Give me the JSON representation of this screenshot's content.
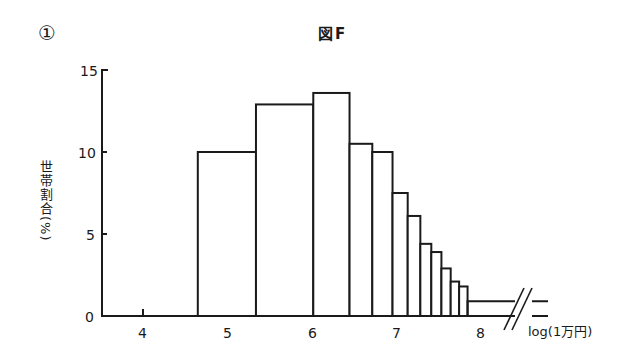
{
  "figure": {
    "panel_number": "①",
    "title": "図F",
    "ylabel": "世帯割合(%)",
    "xlabel": "log(1万円)"
  },
  "axis": {
    "y_ticks": [
      "0",
      "5",
      "10",
      "15"
    ],
    "x_ticks": [
      "4",
      "5",
      "6",
      "7",
      "8"
    ]
  },
  "chart_data": {
    "type": "bar",
    "title": "図F",
    "xlabel": "log(1万円)",
    "ylabel": "世帯割合(%)",
    "ylim": [
      0,
      15
    ],
    "xlim": [
      3.3,
      8.8
    ],
    "y_ticks": [
      0,
      5,
      10,
      15
    ],
    "x_ticks": [
      4,
      5,
      6,
      7,
      8
    ],
    "grid": false,
    "legend": null,
    "note": "Histogram with variable bin widths; last bin extends past an axis break (//).",
    "bins": [
      {
        "x_start": 4.65,
        "x_end": 5.34,
        "value": 10.0
      },
      {
        "x_start": 5.34,
        "x_end": 6.02,
        "value": 12.9
      },
      {
        "x_start": 6.02,
        "x_end": 6.45,
        "value": 13.6
      },
      {
        "x_start": 6.45,
        "x_end": 6.72,
        "value": 10.5
      },
      {
        "x_start": 6.72,
        "x_end": 6.96,
        "value": 10.0
      },
      {
        "x_start": 6.96,
        "x_end": 7.14,
        "value": 7.5
      },
      {
        "x_start": 7.14,
        "x_end": 7.29,
        "value": 6.1
      },
      {
        "x_start": 7.29,
        "x_end": 7.42,
        "value": 4.4
      },
      {
        "x_start": 7.42,
        "x_end": 7.54,
        "value": 3.9
      },
      {
        "x_start": 7.54,
        "x_end": 7.65,
        "value": 2.9
      },
      {
        "x_start": 7.65,
        "x_end": 7.75,
        "value": 2.1
      },
      {
        "x_start": 7.75,
        "x_end": 7.85,
        "value": 1.8
      },
      {
        "x_start": 7.85,
        "x_end": null,
        "value": 0.9
      }
    ],
    "values": [
      10.0,
      12.9,
      13.6,
      10.5,
      10.0,
      7.5,
      6.1,
      4.4,
      3.9,
      2.9,
      2.1,
      1.8,
      0.9
    ],
    "categories": [
      "4.65–5.34",
      "5.34–6.02",
      "6.02–6.45",
      "6.45–6.72",
      "6.72–6.96",
      "6.96–7.14",
      "7.14–7.29",
      "7.29–7.42",
      "7.42–7.54",
      "7.54–7.65",
      "7.65–7.75",
      "7.75–7.85",
      "7.85–"
    ]
  }
}
